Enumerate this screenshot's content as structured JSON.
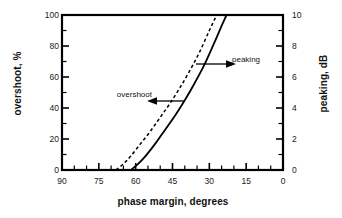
{
  "chart_data": {
    "type": "line",
    "title": "",
    "xlabel": "phase margin, degrees",
    "ylabel": "overshoot, %",
    "ylabel_right": "peaking, dB",
    "xlim": [
      90,
      0
    ],
    "x_reversed": true,
    "ylim": [
      0,
      100
    ],
    "ylim_right": [
      0,
      10
    ],
    "grid": false,
    "legend_position": "inline-annotations",
    "xticks": [
      "90",
      "75",
      "60",
      "45",
      "30",
      "15",
      "0"
    ],
    "xtick_values": [
      90,
      75,
      60,
      45,
      30,
      15,
      0
    ],
    "x_minor_interval": 5,
    "yticks_left": [
      "0",
      "20",
      "40",
      "60",
      "80",
      "100"
    ],
    "ytick_values_left": [
      0,
      20,
      40,
      60,
      80,
      100
    ],
    "y_minor_interval_left": 10,
    "yticks_right": [
      "0",
      "2",
      "4",
      "6",
      "8",
      "10"
    ],
    "ytick_values_right": [
      0,
      2,
      4,
      6,
      8,
      10
    ],
    "y_minor_interval_right": 1,
    "series": [
      {
        "name": "overshoot",
        "style": "dashed",
        "axis": "left",
        "unit": "%",
        "color": "#000000",
        "x": [
          68,
          65,
          62,
          58,
          54,
          50,
          46,
          42,
          38,
          34,
          30,
          27
        ],
        "values": [
          0,
          4,
          9,
          17,
          25,
          34,
          43,
          53,
          64,
          76,
          90,
          100
        ]
      },
      {
        "name": "peaking",
        "style": "solid",
        "axis": "right",
        "unit": "dB",
        "color": "#000000",
        "x": [
          62,
          59,
          56,
          52,
          48,
          44,
          40,
          36,
          32,
          28,
          25,
          23
        ],
        "values": [
          0,
          0.4,
          0.9,
          1.7,
          2.6,
          3.5,
          4.5,
          5.6,
          6.8,
          8.2,
          9.3,
          10
        ]
      }
    ],
    "annotations": [
      {
        "text": "overshoot",
        "arrow": "left",
        "points_to": "dashed-curve",
        "x_px": 152,
        "y_px": 90
      },
      {
        "text": "peaking",
        "arrow": "right",
        "points_to": "solid-curve",
        "x_px": 232,
        "y_px": 55
      }
    ]
  },
  "axes": {
    "left_title": "overshoot, %",
    "right_title": "peaking, dB",
    "bottom_title": "phase margin, degrees"
  },
  "annotations": {
    "overshoot_label": "overshoot",
    "peaking_label": "peaking"
  },
  "colors": {
    "axis": "#000000",
    "curve": "#000000",
    "background": "#ffffff"
  }
}
